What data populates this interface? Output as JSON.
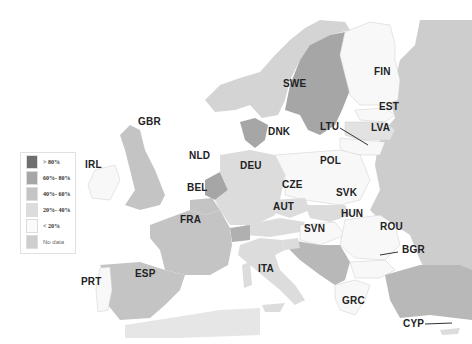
{
  "map": {
    "title": "",
    "type": "choropleth",
    "region": "Europe",
    "colors": {
      "gt80": "#6e6e6e",
      "60_80": "#a6a6a6",
      "40_60": "#c4c4c4",
      "20_40": "#dcdcdc",
      "lt20": "#f8f8f8",
      "nodata": "#cdcdcd",
      "sea": "#ffffff"
    },
    "legend": [
      {
        "label": ">  80%",
        "key": "gt80"
      },
      {
        "label": "60%- 80%",
        "key": "60_80"
      },
      {
        "label": "40%- 60%",
        "key": "40_60"
      },
      {
        "label": "20%- 40%",
        "key": "20_40"
      },
      {
        "label": "<  20%",
        "key": "lt20"
      },
      {
        "label": "No data",
        "key": "nodata"
      }
    ],
    "countries": [
      {
        "code": "FIN",
        "category": "lt20"
      },
      {
        "code": "SWE",
        "category": "60_80"
      },
      {
        "code": "EST",
        "category": "lt20"
      },
      {
        "code": "LVA",
        "category": "20_40"
      },
      {
        "code": "LTU",
        "category": "lt20"
      },
      {
        "code": "DNK",
        "category": "60_80"
      },
      {
        "code": "GBR",
        "category": "40_60"
      },
      {
        "code": "IRL",
        "category": "lt20"
      },
      {
        "code": "NLD",
        "category": "60_80"
      },
      {
        "code": "BEL",
        "category": "40_60"
      },
      {
        "code": "DEU",
        "category": "20_40"
      },
      {
        "code": "POL",
        "category": "lt20"
      },
      {
        "code": "CZE",
        "category": "20_40"
      },
      {
        "code": "SVK",
        "category": "20_40"
      },
      {
        "code": "AUT",
        "category": "20_40"
      },
      {
        "code": "HUN",
        "category": "lt20"
      },
      {
        "code": "ROU",
        "category": "lt20"
      },
      {
        "code": "SVN",
        "category": "20_40"
      },
      {
        "code": "BGR",
        "category": "lt20"
      },
      {
        "code": "FRA",
        "category": "40_60"
      },
      {
        "code": "ESP",
        "category": "40_60"
      },
      {
        "code": "PRT",
        "category": "lt20"
      },
      {
        "code": "ITA",
        "category": "20_40"
      },
      {
        "code": "GRC",
        "category": "lt20"
      },
      {
        "code": "CYP",
        "category": "20_40"
      }
    ]
  }
}
